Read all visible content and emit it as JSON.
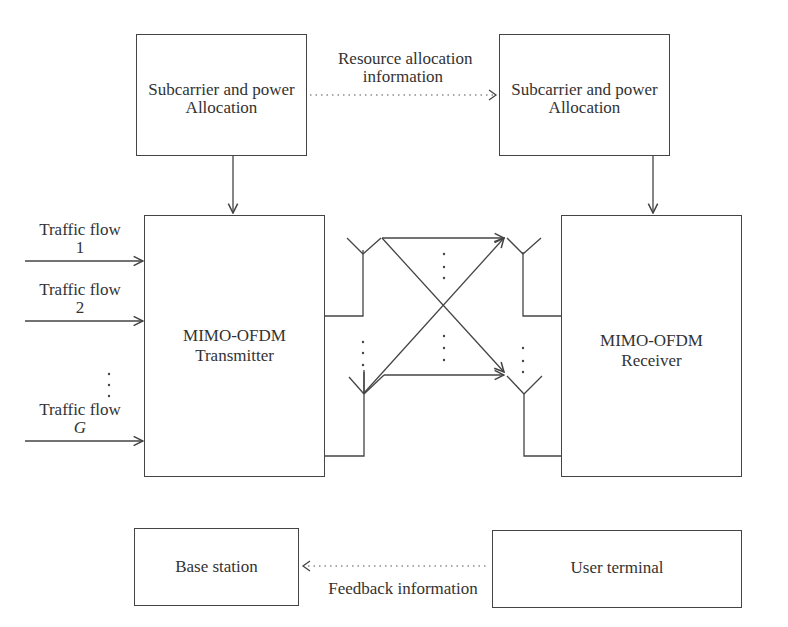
{
  "blocks": {
    "tx_alloc": {
      "line1": "Subcarrier and power",
      "line2": "Allocation"
    },
    "rx_alloc": {
      "line1": "Subcarrier and power",
      "line2": "Allocation"
    },
    "transmitter": {
      "line1": "MIMO-OFDM",
      "line2": "Transmitter"
    },
    "receiver": {
      "line1": "MIMO-OFDM",
      "line2": "Receiver"
    },
    "base_station": {
      "label": "Base station"
    },
    "user_terminal": {
      "label": "User terminal"
    }
  },
  "labels": {
    "resource_allocation": {
      "line1": "Resource allocation",
      "line2": "information"
    },
    "feedback": "Feedback information"
  },
  "traffic_flows": [
    {
      "line1": "Traffic flow",
      "line2": "1"
    },
    {
      "line1": "Traffic flow",
      "line2": "2"
    },
    {
      "line1": "Traffic flow",
      "line2": "G"
    }
  ],
  "ellipsis": "⋮"
}
